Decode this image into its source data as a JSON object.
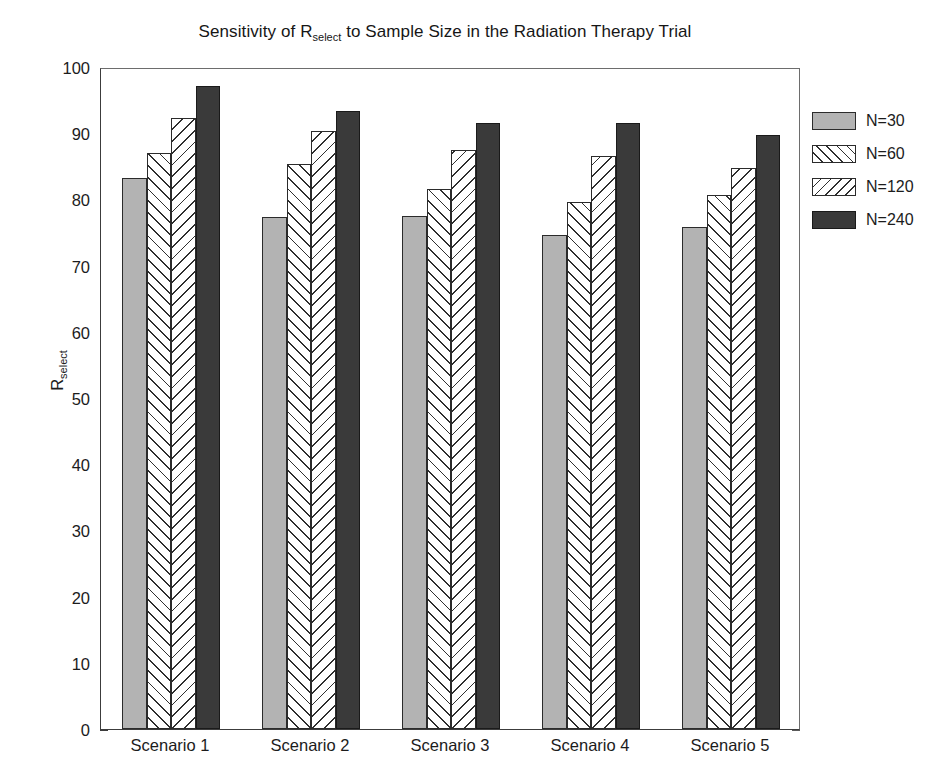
{
  "chart_data": {
    "type": "bar",
    "title_main_before": "Sensitivity of R",
    "title_subscript": "select",
    "title_main_after": " to Sample Size in the Radiation Therapy Trial",
    "xlabel": "",
    "ylabel": "R_select",
    "ylabel_main": "R",
    "ylabel_subscript": "select",
    "ylim": [
      0,
      100
    ],
    "yticks": [
      0,
      10,
      20,
      30,
      40,
      50,
      60,
      70,
      80,
      90,
      100
    ],
    "ytick_labels": [
      "0",
      "10",
      "20",
      "30",
      "40",
      "50",
      "60",
      "70",
      "80",
      "90",
      "100"
    ],
    "grid": false,
    "legend_position": "right-outside",
    "categories": [
      "Scenario 1",
      "Scenario 2",
      "Scenario 3",
      "Scenario 4",
      "Scenario 5"
    ],
    "series": [
      {
        "name": "N=30",
        "fill": "solid-light",
        "color": "#b3b3b3",
        "values": [
          83.2,
          77.3,
          77.5,
          74.6,
          75.9
        ]
      },
      {
        "name": "N=60",
        "fill": "hatch-fwd",
        "color": "#ffffff",
        "values": [
          87.0,
          85.3,
          81.5,
          79.6,
          80.7
        ]
      },
      {
        "name": "N=120",
        "fill": "hatch-bwd",
        "color": "#ffffff",
        "values": [
          92.3,
          90.3,
          87.4,
          86.6,
          84.8
        ]
      },
      {
        "name": "N=240",
        "fill": "solid-dark",
        "color": "#3a3a3a",
        "values": [
          97.2,
          93.4,
          91.5,
          91.6,
          89.7
        ]
      }
    ]
  }
}
